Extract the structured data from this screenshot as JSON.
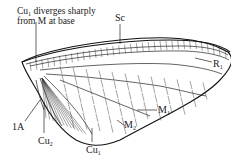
{
  "diagram": {
    "annotation": {
      "line1": "Cu",
      "line1_sub": "1",
      "line1_rest": " diverges sharply",
      "line2": "from M at base"
    },
    "labels": [
      {
        "id": "Sc",
        "main": "Sc",
        "sub": ""
      },
      {
        "id": "R1",
        "main": "R",
        "sub": "1"
      },
      {
        "id": "M1",
        "main": "M",
        "sub": "1"
      },
      {
        "id": "M2",
        "main": "M",
        "sub": "2"
      },
      {
        "id": "Cu1",
        "main": "Cu",
        "sub": "1"
      },
      {
        "id": "Cu2",
        "main": "Cu",
        "sub": "2"
      },
      {
        "id": "1A",
        "main": "1A",
        "sub": ""
      }
    ]
  }
}
